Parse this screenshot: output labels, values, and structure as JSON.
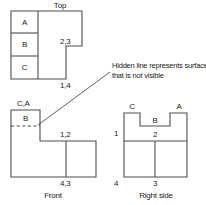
{
  "figure": {
    "type": "orthographic-multiview-drawing",
    "background_color": "#ffffff",
    "line_color": "#4d4d4d",
    "text_color": "#1a1a1a",
    "annotation": {
      "text": "Hidden line represents surface that is not visible",
      "line1": "Hidden line represents surface",
      "line2": "that is not visible"
    }
  },
  "views": {
    "top": {
      "title": "Top",
      "surface_labels": [
        "A",
        "B",
        "C"
      ],
      "point_labels": [
        "2,3",
        "1,4"
      ]
    },
    "front": {
      "title": "Front",
      "surface_labels": [
        "C,A",
        "B"
      ],
      "point_labels": [
        "1,2",
        "4,3"
      ],
      "hidden_line": "dashed"
    },
    "right_side": {
      "title": "Right side",
      "surface_labels": [
        "C",
        "A",
        "B"
      ],
      "point_labels": [
        "1",
        "2",
        "4",
        "3"
      ]
    }
  },
  "labels": {
    "top_title": "Top",
    "top_A": "A",
    "top_B": "B",
    "top_C": "C",
    "top_23": "2,3",
    "top_14": "1,4",
    "front_title": "Front",
    "front_CA": "C,A",
    "front_B": "B",
    "front_12": "1,2",
    "front_43": "4,3",
    "right_title": "Right side",
    "right_C": "C",
    "right_A": "A",
    "right_B": "B",
    "right_1": "1",
    "right_2": "2",
    "right_4": "4",
    "right_3": "3",
    "note_line1": "Hidden line represents surface",
    "note_line2": "that is not visible"
  }
}
